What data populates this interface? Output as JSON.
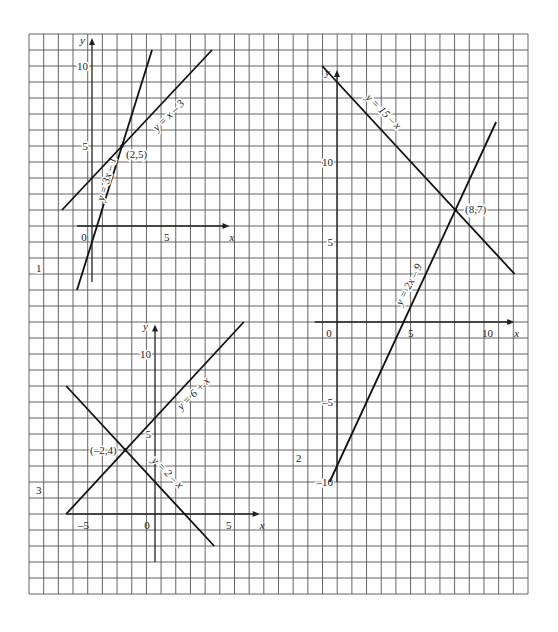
{
  "grid": {
    "left": 29,
    "top": 34,
    "right": 528,
    "bottom": 594,
    "cols": 34,
    "rows": 35,
    "line_color": "#555555"
  },
  "chart_data": [
    {
      "type": "line",
      "panel_label": "1",
      "title": "",
      "xlabel": "x",
      "ylabel": "y",
      "x_ticks": [
        {
          "value": 0,
          "label": "0"
        },
        {
          "value": 5,
          "label": "5"
        }
      ],
      "y_ticks": [
        {
          "value": 5,
          "label": "5"
        },
        {
          "value": 10,
          "label": "10"
        }
      ],
      "xlim": [
        -1,
        9
      ],
      "ylim": [
        -4,
        11
      ],
      "grid": true,
      "series": [
        {
          "name": "y = 3x – 1",
          "label": "y = 3x – 1",
          "x": [
            -1,
            4
          ],
          "y": [
            -4,
            11
          ]
        },
        {
          "name": "y = x – 3",
          "label": "y = x – 3",
          "x": [
            -2,
            8
          ],
          "y": [
            1,
            11
          ]
        }
      ],
      "annotations": [
        {
          "text": "(2,5)",
          "x": 2,
          "y": 5
        }
      ]
    },
    {
      "type": "line",
      "panel_label": "2",
      "title": "",
      "xlabel": "x",
      "ylabel": "y",
      "x_ticks": [
        {
          "value": 0,
          "label": "0"
        },
        {
          "value": 5,
          "label": "5"
        },
        {
          "value": 10,
          "label": "10"
        }
      ],
      "y_ticks": [
        {
          "value": -10,
          "label": "–10"
        },
        {
          "value": -5,
          "label": "–5"
        },
        {
          "value": 5,
          "label": "5"
        },
        {
          "value": 10,
          "label": "10"
        }
      ],
      "xlim": [
        -1,
        12
      ],
      "ylim": [
        -10,
        16
      ],
      "grid": true,
      "series": [
        {
          "name": "y = 15 – x",
          "label": "y = 15 – x",
          "x": [
            -1,
            12
          ],
          "y": [
            16,
            3
          ]
        },
        {
          "name": "y = 2x – 9",
          "label": "y = 2x – 9",
          "x": [
            -0.5,
            10.75
          ],
          "y": [
            -10,
            12.5
          ]
        }
      ],
      "annotations": [
        {
          "text": "(8,7)",
          "x": 8,
          "y": 7
        }
      ]
    },
    {
      "type": "line",
      "panel_label": "3",
      "title": "",
      "xlabel": "x",
      "ylabel": "y",
      "x_ticks": [
        {
          "value": -5,
          "label": "–5"
        },
        {
          "value": 0,
          "label": "0"
        },
        {
          "value": 5,
          "label": "5"
        }
      ],
      "y_ticks": [
        {
          "value": 5,
          "label": "5"
        },
        {
          "value": 10,
          "label": "10"
        }
      ],
      "xlim": [
        -6,
        6
      ],
      "ylim": [
        -2,
        12
      ],
      "grid": true,
      "series": [
        {
          "name": "y = 6 + x",
          "label": "y = 6 + x",
          "x": [
            -6,
            6
          ],
          "y": [
            0,
            12
          ]
        },
        {
          "name": "y = 2 – x",
          "label": "y = 2 – x",
          "x": [
            -6,
            4
          ],
          "y": [
            8,
            -2
          ]
        }
      ],
      "annotations": [
        {
          "text": "(–2,4)",
          "x": -2,
          "y": 4
        }
      ]
    }
  ],
  "panels_layout": [
    {
      "origin": [
        92,
        226
      ],
      "ux": 15.0,
      "uy": 16.0,
      "x_axis": [
        -1,
        8.9
      ],
      "y_axis": [
        -3.5,
        11.5
      ],
      "panel_label_pos": [
        36,
        272
      ],
      "line_label_pos": [
        {
          "x": 110,
          "y": 180,
          "rot": -74
        },
        {
          "x": 171,
          "y": 118,
          "rot": -45
        }
      ],
      "annotation_pos": [
        {
          "x": 126,
          "y": 158
        }
      ]
    },
    {
      "origin": [
        337,
        322
      ],
      "ux": 14.8,
      "uy": 16.0,
      "x_axis": [
        -1.5,
        11.7
      ],
      "y_axis": [
        -10,
        15.5
      ],
      "panel_label_pos": [
        296,
        462
      ],
      "line_label_pos": [
        {
          "x": 381,
          "y": 114,
          "rot": 45
        },
        {
          "x": 412,
          "y": 286,
          "rot": -63
        }
      ],
      "annotation_pos": [
        {
          "x": 465,
          "y": 213
        }
      ]
    },
    {
      "origin": [
        155,
        514
      ],
      "ux": 14.8,
      "uy": 16.0,
      "x_axis": [
        -6,
        6.8
      ],
      "y_axis": [
        -3,
        11.6
      ],
      "panel_label_pos": [
        36,
        494
      ],
      "line_label_pos": [
        {
          "x": 196,
          "y": 396,
          "rot": -45
        },
        {
          "x": 165,
          "y": 475,
          "rot": 45
        }
      ],
      "annotation_pos": [
        {
          "x": 90,
          "y": 454
        }
      ]
    }
  ]
}
